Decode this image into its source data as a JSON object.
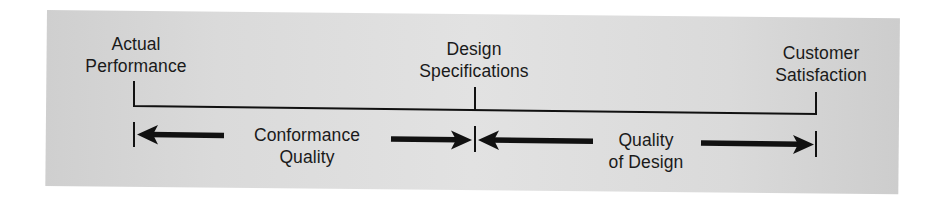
{
  "diagram": {
    "type": "quality-continuum",
    "background_color": "#d8d8d8",
    "line_color": "#111111",
    "points": [
      {
        "id": "actual-performance",
        "line1": "Actual",
        "line2": "Performance"
      },
      {
        "id": "design-specifications",
        "line1": "Design",
        "line2": "Specifications"
      },
      {
        "id": "customer-satisfaction",
        "line1": "Customer",
        "line2": "Satisfaction"
      }
    ],
    "spans": [
      {
        "id": "conformance-quality",
        "line1": "Conformance",
        "line2": "Quality",
        "from": "actual-performance",
        "to": "design-specifications"
      },
      {
        "id": "quality-of-design",
        "line1": "Quality",
        "line2": "of Design",
        "from": "design-specifications",
        "to": "customer-satisfaction"
      }
    ]
  }
}
